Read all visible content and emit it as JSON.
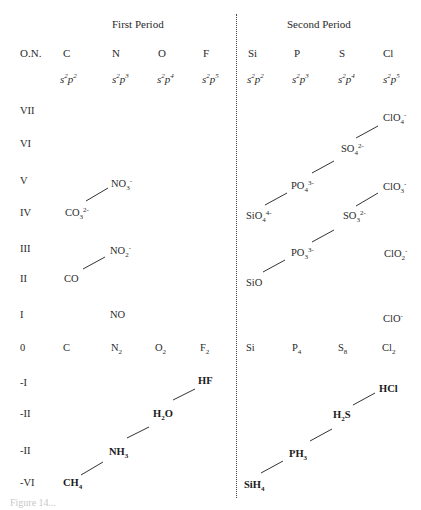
{
  "headers": {
    "first_period": "First Period",
    "second_period": "Second Period",
    "on_label": "O.N."
  },
  "elements": [
    {
      "symbol": "C",
      "config": [
        "s",
        "2",
        "p",
        "2"
      ]
    },
    {
      "symbol": "N",
      "config": [
        "s",
        "2",
        "p",
        "3"
      ]
    },
    {
      "symbol": "O",
      "config": [
        "s",
        "2",
        "p",
        "4"
      ]
    },
    {
      "symbol": "F",
      "config": [
        "s",
        "2",
        "p",
        "5"
      ]
    },
    {
      "symbol": "Si",
      "config": [
        "s",
        "2",
        "p",
        "2"
      ]
    },
    {
      "symbol": "P",
      "config": [
        "s",
        "2",
        "p",
        "3"
      ]
    },
    {
      "symbol": "S",
      "config": [
        "s",
        "2",
        "p",
        "4"
      ]
    },
    {
      "symbol": "Cl",
      "config": [
        "s",
        "2",
        "p",
        "5"
      ]
    }
  ],
  "oxidation_numbers": [
    "VII",
    "VI",
    "V",
    "IV",
    "III",
    "II",
    "I",
    "0",
    "-I",
    "-II",
    "-II",
    "-VI"
  ],
  "species": {
    "no3": {
      "base": "NO",
      "sub": "3",
      "sup": "-"
    },
    "co3": {
      "base": "CO",
      "sub": "3",
      "sup": "2-"
    },
    "no2m": {
      "base": "NO",
      "sub": "2",
      "sup": "-"
    },
    "co": {
      "base": "CO",
      "sub": "",
      "sup": ""
    },
    "no": {
      "base": "NO",
      "sub": "",
      "sup": ""
    },
    "c": {
      "base": "C",
      "sub": "",
      "sup": ""
    },
    "n2": {
      "base": "N",
      "sub": "2",
      "sup": ""
    },
    "o2": {
      "base": "O",
      "sub": "2",
      "sup": ""
    },
    "f2": {
      "base": "F",
      "sub": "2",
      "sup": ""
    },
    "hf": {
      "base": "HF",
      "sub": "",
      "sup": ""
    },
    "h2o": {
      "base": "H",
      "sub": "2",
      "tail": "O"
    },
    "nh3": {
      "base": "NH",
      "sub": "3",
      "sup": ""
    },
    "ch4": {
      "base": "CH",
      "sub": "4",
      "sup": ""
    },
    "clo4": {
      "base": "ClO",
      "sub": "4",
      "sup": "-"
    },
    "so4": {
      "base": "SO",
      "sub": "4",
      "sup": "2-"
    },
    "po4": {
      "base": "PO",
      "sub": "4",
      "sup": "3-"
    },
    "clo3": {
      "base": "ClO",
      "sub": "3",
      "sup": "-"
    },
    "sio4": {
      "base": "SiO",
      "sub": "4",
      "sup": "4-"
    },
    "so3": {
      "base": "SO",
      "sub": "3",
      "sup": "2-"
    },
    "po3": {
      "base": "PO",
      "sub": "3",
      "sup": "3-"
    },
    "clo2": {
      "base": "ClO",
      "sub": "2",
      "sup": "-"
    },
    "sio": {
      "base": "SiO",
      "sub": "",
      "sup": ""
    },
    "clo": {
      "base": "ClO",
      "sub": "",
      "sup": "-"
    },
    "si": {
      "base": "Si",
      "sub": "",
      "sup": ""
    },
    "p4": {
      "base": "P",
      "sub": "4",
      "sup": ""
    },
    "s8": {
      "base": "S",
      "sub": "8",
      "sup": ""
    },
    "cl2": {
      "base": "Cl",
      "sub": "2",
      "sup": ""
    },
    "hcl": {
      "base": "HCl",
      "sub": "",
      "sup": ""
    },
    "h2s": {
      "base": "H",
      "sub": "2",
      "tail": "S"
    },
    "ph3": {
      "base": "PH",
      "sub": "3",
      "sup": ""
    },
    "sih4": {
      "base": "SiH",
      "sub": "4",
      "sup": ""
    }
  },
  "caption": "Figure 14..."
}
